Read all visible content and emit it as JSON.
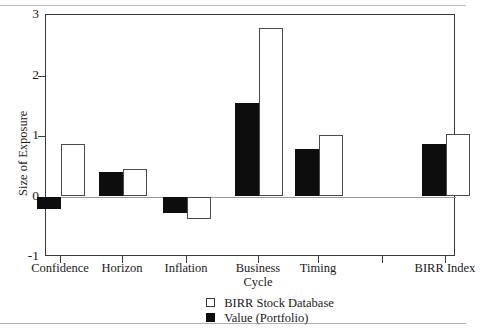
{
  "chart_data": {
    "type": "bar",
    "title": "",
    "subtitle": "",
    "xlabel": "",
    "ylabel": "Size of Exposure",
    "categories": [
      "Confidence",
      "Horizon",
      "Inflation",
      "Business Cycle",
      "Timing",
      "BIRR Index"
    ],
    "category_lines": [
      [
        "Confidence"
      ],
      [
        "Horizon"
      ],
      [
        "Inflation"
      ],
      [
        "Business",
        "Cycle"
      ],
      [
        "Timing"
      ],
      [
        "BIRR Index"
      ]
    ],
    "series": [
      {
        "name": "Value (Portfolio)",
        "style": "filled-black",
        "color": "#0d0d0d",
        "values": [
          -0.2,
          0.4,
          -0.28,
          1.55,
          0.78,
          0.87
        ]
      },
      {
        "name": "BIRR Stock Database",
        "style": "open-white",
        "color": "#ffffff",
        "values": [
          0.86,
          0.46,
          -0.38,
          2.79,
          1.02,
          1.03
        ]
      }
    ],
    "ylim": [
      -1,
      3
    ],
    "yticks": [
      -1,
      0,
      1,
      2,
      3
    ],
    "ytick_labels": [
      "-1",
      "0",
      "1",
      "2",
      "3"
    ],
    "grid": false,
    "zero_line": true,
    "legend_position": "bottom-center",
    "legend_entries": [
      {
        "label": "BIRR Stock Database",
        "swatch": "open-square"
      },
      {
        "label": "Value (Portfolio)",
        "swatch": "filled-square"
      }
    ]
  },
  "axis": {
    "y_title": "Size of Exposure"
  }
}
